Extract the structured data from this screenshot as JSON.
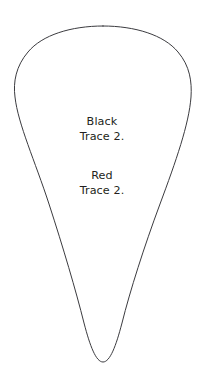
{
  "canvas": {
    "width": 204,
    "height": 386,
    "background_color": "#ffffff"
  },
  "shape": {
    "name": "teardrop-outline",
    "stroke_color": "#3b3b3f",
    "stroke_width": 1,
    "fill": "none",
    "description": "Teardrop / guitar-pick outline: broad flattened dome across the top, widest near the upper third, tapering down both sides to a narrow rounded point at the bottom center",
    "path": "M 103 26 C 135 26 164 35 178 52 C 190 66 192 82 191 97 C 189 124 176 161 160 204 C 144 247 130 291 122 323 C 116 346 110 362 103 362 C 96 362 90 346 84 323 C 76 291 63 247 49 204 C 35 161 18 124 15 97 C 13 82 16 66 28 52 C 42 35 71 26 103 26 Z",
    "extents": {
      "top_y": 26,
      "bottom_y": 362,
      "left_x": 15,
      "right_x": 191,
      "widest_y": 97,
      "center_x": 103
    }
  },
  "labels": {
    "black": {
      "name": "Black",
      "trace": "Trace 2.",
      "color": "#231f20"
    },
    "red": {
      "name": "Red",
      "trace": "Trace 2.",
      "color": "#231f20"
    }
  }
}
